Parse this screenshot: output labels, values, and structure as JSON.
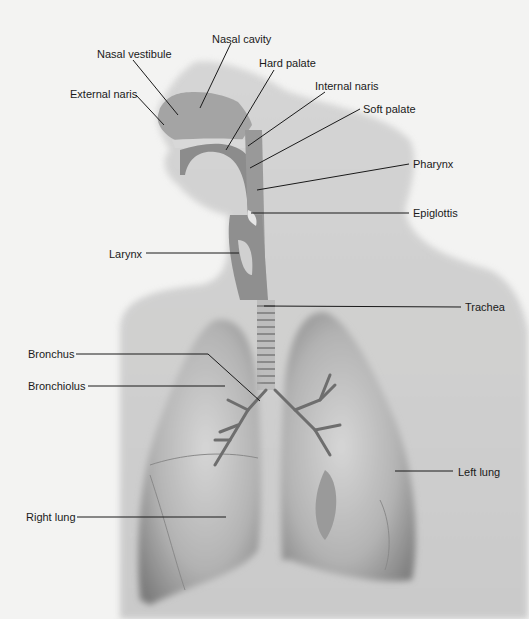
{
  "figure": {
    "labels": [
      {
        "id": "nasal-cavity",
        "text": "Nasal cavity",
        "x": 212,
        "y": 33
      },
      {
        "id": "nasal-vestibule",
        "text": "Nasal vestibule",
        "x": 97,
        "y": 48
      },
      {
        "id": "hard-palate",
        "text": "Hard palate",
        "x": 259,
        "y": 57
      },
      {
        "id": "external-naris",
        "text": "External naris",
        "x": 70,
        "y": 88
      },
      {
        "id": "internal-naris",
        "text": "Internal naris",
        "x": 315,
        "y": 80
      },
      {
        "id": "soft-palate",
        "text": "Soft palate",
        "x": 363,
        "y": 103
      },
      {
        "id": "pharynx",
        "text": "Pharynx",
        "x": 413,
        "y": 158
      },
      {
        "id": "epiglottis",
        "text": "Epiglottis",
        "x": 413,
        "y": 207
      },
      {
        "id": "larynx",
        "text": "Larynx",
        "x": 109,
        "y": 248
      },
      {
        "id": "trachea",
        "text": "Trachea",
        "x": 465,
        "y": 301
      },
      {
        "id": "bronchus",
        "text": "Bronchus",
        "x": 28,
        "y": 348
      },
      {
        "id": "bronchiolus",
        "text": "Bronchiolus",
        "x": 28,
        "y": 380
      },
      {
        "id": "left-lung",
        "text": "Left lung",
        "x": 458,
        "y": 466
      },
      {
        "id": "right-lung",
        "text": "Right lung",
        "x": 26,
        "y": 511
      }
    ],
    "colors": {
      "background": "#f3f3f2",
      "body_silhouette": "#c9c9c9",
      "lung": "#a8a8a8",
      "lung_light": "#cfcfcf",
      "airway": "#8e8e8e",
      "leader_line": "#1a1a1a"
    }
  }
}
